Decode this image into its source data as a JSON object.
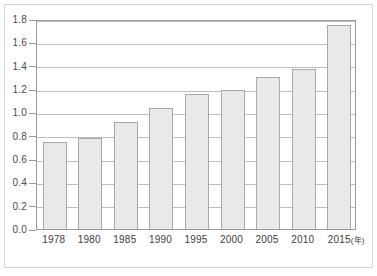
{
  "chart_data": {
    "type": "bar",
    "title": "",
    "subtitle": "",
    "xlabel": "",
    "ylabel": "",
    "xunit_label": "(年)",
    "categories": [
      "1978",
      "1980",
      "1985",
      "1990",
      "1995",
      "2000",
      "2005",
      "2010",
      "2015"
    ],
    "values": [
      0.75,
      0.78,
      0.92,
      1.04,
      1.16,
      1.19,
      1.3,
      1.37,
      1.75
    ],
    "ylim": [
      0.0,
      1.8
    ],
    "ytick_labels": [
      "0.0",
      "0.2",
      "0.4",
      "0.6",
      "0.8",
      "1.0",
      "1.2",
      "1.4",
      "1.6",
      "1.8"
    ],
    "ytick_values": [
      0.0,
      0.2,
      0.4,
      0.6,
      0.8,
      1.0,
      1.2,
      1.4,
      1.6,
      1.8
    ],
    "grid": true,
    "legend": false,
    "legend_position": "none",
    "bar_fill_color": "#e9e9e9",
    "bar_border_color": "#a8a8a8",
    "gridline_color": "#bdbdbd",
    "plot_frame_color": "#9a9a9a",
    "outer_frame_color": "#d6d6d6",
    "background_color": "#ffffff",
    "label_color": "#4a4a4a"
  }
}
